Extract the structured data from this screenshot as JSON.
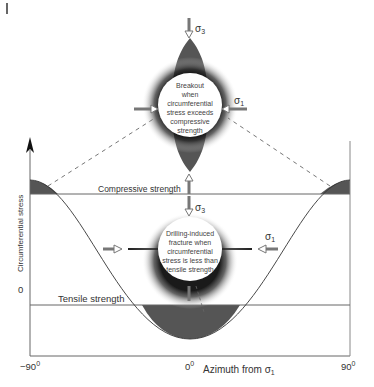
{
  "diagram": {
    "y_axis_label": "Circumferential stress",
    "y_zero_label": "0",
    "x_axis_label_prefix": "Azimuth from σ",
    "x_axis_label_sub": "1",
    "x_ticks": [
      {
        "label": "−90",
        "sup": "0"
      },
      {
        "label": "0",
        "sup": "0"
      },
      {
        "label": "90",
        "sup": "0"
      }
    ],
    "compressive_strength_label": "Compressive strength",
    "tensile_strength_label": "Tensile strength",
    "breakout_box": {
      "lines": [
        "Breakout",
        "when",
        "circumferential",
        "stress exceeds",
        "compressive",
        "strength"
      ],
      "sigma3": "σ",
      "sigma3_sub": "3",
      "sigma1": "σ",
      "sigma1_sub": "1"
    },
    "fracture_box": {
      "lines": [
        "Drilling-induced",
        "fracture when",
        "circumferential",
        "stress is less than",
        "tensile strength"
      ],
      "sigma3": "σ",
      "sigma3_sub": "3",
      "sigma1": "σ",
      "sigma1_sub": "1"
    },
    "colors": {
      "fill": "#555555",
      "line": "#444444",
      "arrow": "#777777"
    }
  }
}
